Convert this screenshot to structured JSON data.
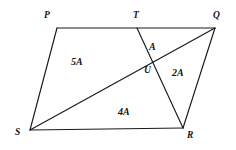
{
  "figure": {
    "kind": "geometry-diagram",
    "shape": "parallelogram-with-cevians",
    "background_color": "#ffffff",
    "stroke_color": "#1a1a1a",
    "text_color": "#141414"
  },
  "vertices": [
    {
      "id": "P",
      "label": "P",
      "x": 57,
      "y": 28,
      "label_x": 44,
      "label_y": 11
    },
    {
      "id": "T",
      "label": "T",
      "x": 137,
      "y": 28,
      "label_x": 133,
      "label_y": 11
    },
    {
      "id": "Q",
      "label": "Q",
      "x": 215,
      "y": 28,
      "label_x": 213,
      "label_y": 11
    },
    {
      "id": "U",
      "label": "U",
      "x": 151,
      "y": 62,
      "label_x": 144,
      "label_y": 66
    },
    {
      "id": "S",
      "label": "S",
      "x": 30,
      "y": 130,
      "label_x": 15,
      "label_y": 128
    },
    {
      "id": "R",
      "label": "R",
      "x": 183,
      "y": 128,
      "label_x": 187,
      "label_y": 131
    }
  ],
  "edges": [
    {
      "id": "PQ",
      "from": "P",
      "to": "Q",
      "description": "top side through T"
    },
    {
      "id": "PS",
      "from": "P",
      "to": "S",
      "description": "left side"
    },
    {
      "id": "SR",
      "from": "S",
      "to": "R",
      "description": "bottom side"
    },
    {
      "id": "QR",
      "from": "Q",
      "to": "R",
      "description": "right side"
    },
    {
      "id": "SQ",
      "from": "S",
      "to": "Q",
      "description": "diagonal through U"
    },
    {
      "id": "TR",
      "from": "T",
      "to": "R",
      "description": "cevian through U"
    }
  ],
  "region_labels": [
    {
      "id": "region-5A",
      "text": "5A",
      "x": 71,
      "y": 57,
      "region": "quadrilateral P T U S"
    },
    {
      "id": "region-A",
      "text": "A",
      "x": 149,
      "y": 42,
      "region": "triangle T Q U"
    },
    {
      "id": "region-2A",
      "text": "2A",
      "x": 172,
      "y": 68,
      "region": "triangle U Q R"
    },
    {
      "id": "region-4A",
      "text": "4A",
      "x": 118,
      "y": 107,
      "region": "triangle S U R"
    }
  ]
}
